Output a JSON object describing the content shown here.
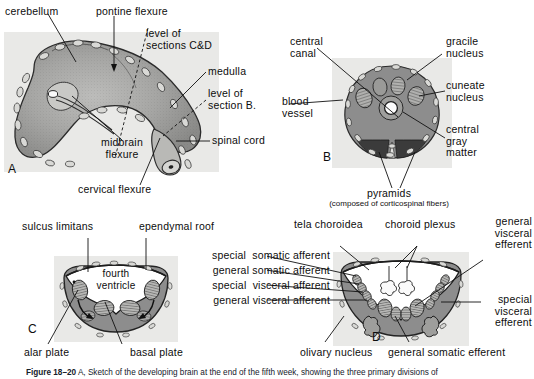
{
  "figure": {
    "caption_bold": "Figure 18–20",
    "caption_text": "  A, Sketch of the developing brain at the end of the fifth week, showing the three primary divisions of",
    "panels": [
      "A",
      "B",
      "C",
      "D"
    ]
  },
  "colors": {
    "plate_background": "#e8e8e6",
    "tissue_gray": "#8d8d8d",
    "dark_gray": "#3f3f3f",
    "line_black": "#111111",
    "paper": "#ffffff"
  },
  "panel_a": {
    "letter": "A",
    "labels": {
      "cerebellum": "cerebellum",
      "pontine_flexure": "pontine flexure",
      "level_sections_cd": "level of\nsections C&D",
      "medulla": "medulla",
      "level_section_b": "level of\nsection B.",
      "spinal_cord": "spinal cord",
      "midbrain_flexure": "midbrain\nflexure",
      "cervical_flexure": "cervical flexure"
    }
  },
  "panel_b": {
    "letter": "B",
    "labels": {
      "central_canal": "central\ncanal",
      "gracile_nucleus": "gracile\nnucleus",
      "cuneate_nucleus": "cuneate\nnucleus",
      "blood_vessel": "blood\nvessel",
      "central_gray_matter": "central\ngray\nmatter",
      "pyramids": "pyramids",
      "pyramids_note": "(composed of corticospinal fibers)"
    }
  },
  "panel_c": {
    "letter": "C",
    "labels": {
      "sulcus_limitans": "sulcus limitans",
      "ependymal_roof": "ependymal roof",
      "fourth_ventricle": "fourth\nventricle",
      "alar_plate": "alar plate",
      "basal_plate": "basal plate"
    }
  },
  "panel_d": {
    "letter": "D",
    "labels": {
      "tela_choroidea": "tela choroidea",
      "choroid_plexus": "choroid plexus",
      "general_visceral_efferent": "general\nvisceral\nefferent",
      "special_visceral_efferent": "special\nvisceral\nefferent",
      "special_somatic_afferent": "special  somatic afferent",
      "general_somatic_afferent": "general somatic afferent",
      "special_visceral_afferent": "special  visceral afferent",
      "general_visceral_afferent": "general visceral afferent",
      "olivary_nucleus": "olivary nucleus",
      "general_somatic_efferent": "general somatic efferent"
    }
  }
}
